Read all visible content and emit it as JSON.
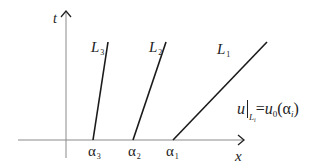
{
  "figure": {
    "axes": {
      "x_label": "x",
      "t_label": "t"
    },
    "lines": [
      {
        "id": "L1",
        "label": "L",
        "label_sub": "1",
        "foot_label": "α",
        "foot_sub": "1"
      },
      {
        "id": "L2",
        "label": "L",
        "label_sub": "2",
        "foot_label": "α",
        "foot_sub": "2"
      },
      {
        "id": "L3",
        "label": "L",
        "label_sub": "3",
        "foot_label": "α",
        "foot_sub": "3"
      }
    ],
    "formula": {
      "lhs": "u",
      "restrict_sub": "L",
      "restrict_subsub": "i",
      "equals": "=",
      "rhs_func": "u",
      "rhs_func_sub": "0",
      "open_paren": "(",
      "rhs_arg": "α",
      "rhs_arg_sub": "i",
      "close_paren": ")"
    },
    "colors": {
      "axis": "#8a8a8a",
      "line": "#1a1a1a",
      "text": "#222222"
    }
  }
}
